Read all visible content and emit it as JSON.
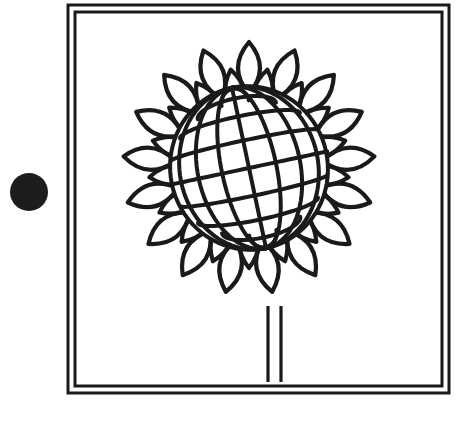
{
  "canvas": {
    "width": 469,
    "height": 428,
    "background_color": "#ffffff",
    "ink_color": "#1a1a1a"
  },
  "bullet_marker": {
    "name": "black-dot",
    "shape": "filled-circle",
    "center_x": 29,
    "center_y": 192,
    "radius": 19,
    "color": "#1d1d1d"
  },
  "frame": {
    "name": "double-line-square-border",
    "outer": {
      "x": 68,
      "y": 5,
      "width": 381,
      "height": 388
    },
    "inner": {
      "x": 75,
      "y": 12,
      "width": 367,
      "height": 374
    },
    "outer_stroke_width": 3,
    "inner_stroke_width": 3,
    "stroke_color": "#1a1a1a",
    "fill": "none"
  },
  "figure": {
    "name": "sunflower-line-drawing",
    "center_x": 249,
    "center_y": 168,
    "stroke_color": "#1a1a1a",
    "fill_color": "#ffffff",
    "stroke_width": 4.2
  },
  "petals": {
    "outer_ring": {
      "count": 17,
      "inner_radius": 74,
      "tip_radius": 126,
      "half_width": 22,
      "start_angle_deg": -90
    },
    "inner_ring": {
      "count": 17,
      "inner_radius": 52,
      "tip_radius": 100,
      "half_width": 19,
      "start_angle_deg": -79.4
    }
  },
  "disc": {
    "name": "seed-head-grid",
    "shape": "sphere-mesh",
    "center_x": 249,
    "center_y": 168,
    "radius_x": 80,
    "radius_y": 82,
    "meridian_count": 9,
    "parallel_count": 9,
    "tilt_deg": -12,
    "stroke_width": 4
  },
  "stem": {
    "name": "flower-stem",
    "left_line_x": 268,
    "right_line_x": 281,
    "top_y": 306,
    "bottom_y": 382,
    "stroke_width": 3.2
  }
}
